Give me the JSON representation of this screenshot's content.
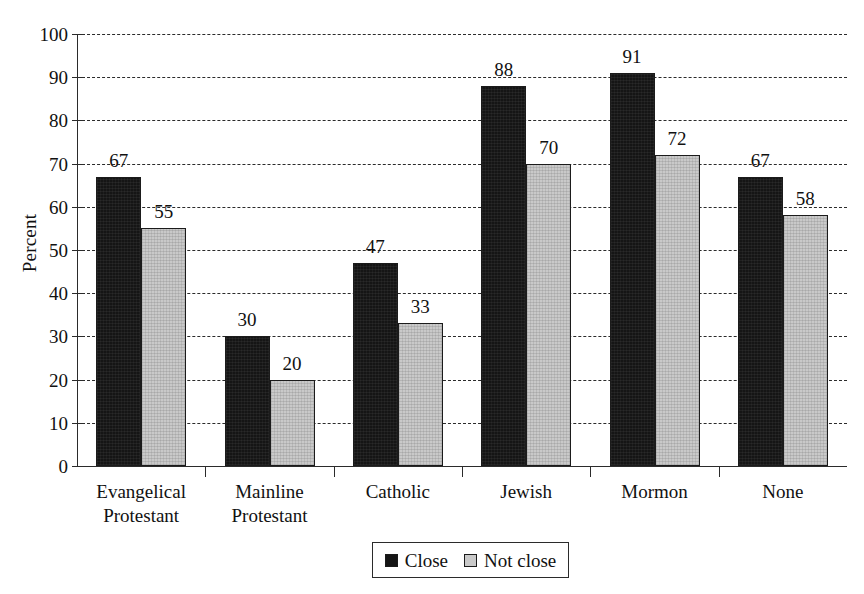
{
  "chart_data": {
    "type": "bar",
    "title": "",
    "xlabel": "",
    "ylabel": "Percent",
    "ylim": [
      0,
      100
    ],
    "ytick_step": 10,
    "yticks": [
      0,
      10,
      20,
      30,
      40,
      50,
      60,
      70,
      80,
      90,
      100
    ],
    "grid": true,
    "grid_style": "dashed horizontal",
    "legend_position": "bottom-center",
    "categories": [
      "Evangelical Protestant",
      "Mainline Protestant",
      "Catholic",
      "Jewish",
      "Mormon",
      "None"
    ],
    "category_lines": [
      [
        "Evangelical",
        "Protestant"
      ],
      [
        "Mainline",
        "Protestant"
      ],
      [
        "Catholic",
        ""
      ],
      [
        "Jewish",
        ""
      ],
      [
        "Mormon",
        ""
      ],
      [
        "None",
        ""
      ]
    ],
    "series": [
      {
        "name": "Close",
        "color": "#151515",
        "values": [
          67,
          30,
          47,
          88,
          91,
          67
        ]
      },
      {
        "name": "Not close",
        "color": "#c9c9c9",
        "values": [
          55,
          20,
          33,
          70,
          72,
          58
        ]
      }
    ]
  },
  "legend": {
    "items": [
      {
        "label": "Close",
        "swatch": "close"
      },
      {
        "label": "Not close",
        "swatch": "notclose"
      }
    ]
  }
}
